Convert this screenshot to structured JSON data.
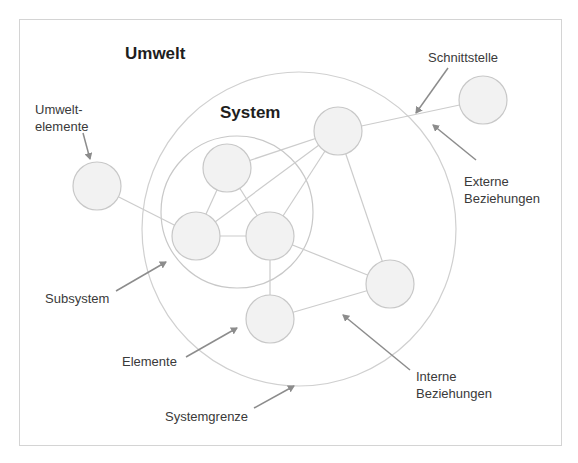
{
  "titles": {
    "environment": "Umwelt",
    "system": "System"
  },
  "labels": {
    "environment_elements_line1": "Umwelt-",
    "environment_elements_line2": "elemente",
    "interface": "Schnittstelle",
    "external_relations_line1": "Externe",
    "external_relations_line2": "Beziehungen",
    "subsystem": "Subsystem",
    "elements": "Elemente",
    "internal_relations_line1": "Interne",
    "internal_relations_line2": "Beziehungen",
    "system_boundary": "Systemgrenze"
  },
  "colors": {
    "node_fill": "#f2f2f2",
    "node_stroke": "#c8c8c8",
    "edge": "#cccccc",
    "arrow": "#8c8c8c",
    "text": "#3a3a3a"
  }
}
